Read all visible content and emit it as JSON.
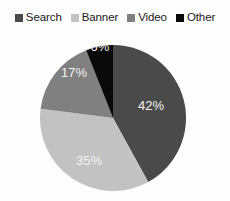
{
  "legend": {
    "items": [
      {
        "label": "Search",
        "color": "#4a4a4a",
        "swatch_icon": "square-swatch-icon"
      },
      {
        "label": "Banner",
        "color": "#c2c2c2",
        "swatch_icon": "square-swatch-icon"
      },
      {
        "label": "Video",
        "color": "#808080",
        "swatch_icon": "square-swatch-icon"
      },
      {
        "label": "Other",
        "color": "#0a0a0a",
        "swatch_icon": "square-swatch-icon"
      }
    ]
  },
  "chart_data": {
    "type": "pie",
    "title": "",
    "subtitle": "",
    "xlabel": "",
    "ylabel": "",
    "grid": false,
    "legend_position": "top",
    "start_angle_deg": 0,
    "direction": "clockwise",
    "units": "percent",
    "categories": [
      "Search",
      "Banner",
      "Video",
      "Other"
    ],
    "values": [
      42,
      35,
      17,
      6
    ],
    "colors": [
      "#4a4a4a",
      "#c2c2c2",
      "#808080",
      "#0a0a0a"
    ],
    "data_labels": [
      "42%",
      "35%",
      "17%",
      "6%"
    ],
    "slices": [
      {
        "name": "Search",
        "value": 42,
        "label": "42%",
        "color": "#4a4a4a",
        "start_deg": 0,
        "end_deg": 151.2,
        "label_x": 151,
        "label_y": 77,
        "label_color": "#f2f2f2"
      },
      {
        "name": "Banner",
        "value": 35,
        "label": "35%",
        "color": "#c2c2c2",
        "start_deg": 151.2,
        "end_deg": 277.2,
        "label_x": 89,
        "label_y": 132,
        "label_color": "#f7f7f7"
      },
      {
        "name": "Video",
        "value": 17,
        "label": "17%",
        "color": "#808080",
        "start_deg": 277.2,
        "end_deg": 338.4,
        "label_x": 74,
        "label_y": 44,
        "label_color": "#f7f7f7"
      },
      {
        "name": "Other",
        "value": 6,
        "label": "6%",
        "color": "#0a0a0a",
        "start_deg": 338.4,
        "end_deg": 360,
        "label_x": 100,
        "label_y": 18,
        "label_color": "#f2f2f2"
      }
    ],
    "geometry": {
      "center_x": 113,
      "center_y": 88,
      "radius": 73
    }
  }
}
